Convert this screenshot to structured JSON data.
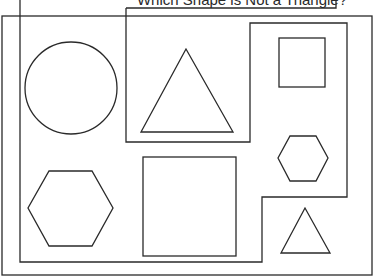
{
  "diagram": {
    "title_label": "Which Shape is Not a Triangle?",
    "stroke_color": "#2a2a2a",
    "background": "#ffffff",
    "regions": [
      {
        "name": "outer-frame"
      },
      {
        "name": "inner-region"
      },
      {
        "name": "middle-box"
      },
      {
        "name": "label-box"
      }
    ],
    "shapes": [
      {
        "type": "circle",
        "name": "circle-shape"
      },
      {
        "type": "triangle",
        "name": "large-triangle-shape"
      },
      {
        "type": "square",
        "name": "small-square-shape"
      },
      {
        "type": "hexagon",
        "name": "small-hexagon-shape"
      },
      {
        "type": "hexagon",
        "name": "large-hexagon-shape"
      },
      {
        "type": "square",
        "name": "large-square-shape"
      },
      {
        "type": "triangle",
        "name": "small-triangle-shape"
      }
    ]
  }
}
